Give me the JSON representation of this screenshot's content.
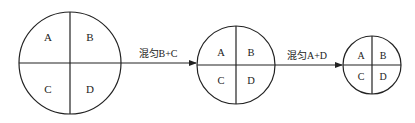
{
  "diagram": {
    "stages": [
      {
        "quadrants": [
          "A",
          "B",
          "C",
          "D"
        ]
      },
      {
        "quadrants": [
          "A",
          "B",
          "C",
          "D"
        ]
      },
      {
        "quadrants": [
          "A",
          "B",
          "C",
          "D"
        ]
      }
    ],
    "arrows": [
      {
        "label": "混匀B+C"
      },
      {
        "label": "混匀A+D"
      }
    ]
  }
}
